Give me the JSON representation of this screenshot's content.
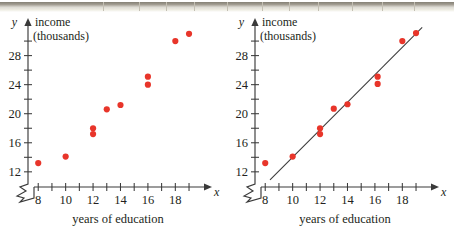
{
  "figure": {
    "background": "#ffffff",
    "point_color": "#e8352a",
    "axis_color": "#3a3a3a",
    "panels": [
      "left-scatter",
      "right-scatter-with-line"
    ]
  },
  "chart_data": [
    {
      "type": "scatter",
      "panel_name": "scatter-plot-no-line",
      "title": "",
      "xlabel": "years of education",
      "ylabel": "income",
      "ylabel_sub": "(thousands)",
      "x_axis_symbol": "x",
      "y_axis_symbol": "y",
      "xlim": [
        7.4,
        19.8
      ],
      "ylim": [
        10.6,
        31.8
      ],
      "xticks": [
        8,
        9,
        10,
        11,
        12,
        13,
        14,
        15,
        16,
        17,
        18,
        19
      ],
      "xticklabels": [
        "8",
        "",
        "10",
        "",
        "12",
        "",
        "14",
        "",
        "16",
        "",
        "18",
        ""
      ],
      "yticks": [
        12,
        14,
        16,
        18,
        20,
        22,
        24,
        26,
        28,
        30
      ],
      "yticklabels": [
        "12",
        "",
        "16",
        "",
        "20",
        "",
        "24",
        "",
        "28",
        ""
      ],
      "axis_break": true,
      "grid": false,
      "legend": "none",
      "x": [
        8,
        10,
        12,
        12,
        13,
        14,
        16,
        16,
        18,
        19
      ],
      "y": [
        13.2,
        14.1,
        18.0,
        17.2,
        20.6,
        21.2,
        25.1,
        24.0,
        30.0,
        31.0
      ]
    },
    {
      "type": "scatter",
      "panel_name": "scatter-plot-with-regression-line",
      "title": "",
      "xlabel": "years of education",
      "ylabel": "income",
      "ylabel_sub": "(thousands)",
      "x_axis_symbol": "x",
      "y_axis_symbol": "y",
      "xlim": [
        7.4,
        19.8
      ],
      "ylim": [
        10.6,
        31.8
      ],
      "xticks": [
        8,
        9,
        10,
        11,
        12,
        13,
        14,
        15,
        16,
        17,
        18,
        19
      ],
      "xticklabels": [
        "8",
        "",
        "10",
        "",
        "12",
        "",
        "14",
        "",
        "16",
        "",
        "18",
        ""
      ],
      "yticks": [
        12,
        14,
        16,
        18,
        20,
        22,
        24,
        26,
        28,
        30
      ],
      "yticklabels": [
        "12",
        "",
        "16",
        "",
        "20",
        "",
        "24",
        "",
        "28",
        ""
      ],
      "axis_break": true,
      "grid": false,
      "legend": "none",
      "x": [
        8,
        10,
        12,
        12,
        13,
        14,
        16.2,
        16.2,
        18,
        19
      ],
      "y": [
        13.2,
        14.1,
        18.0,
        17.2,
        20.7,
        21.3,
        25.1,
        24.1,
        30.0,
        31.1
      ],
      "trendline": {
        "label": "regression line",
        "x_start": 8.35,
        "y_start": 10.9,
        "x_end": 19.45,
        "y_end": 31.9
      }
    }
  ]
}
